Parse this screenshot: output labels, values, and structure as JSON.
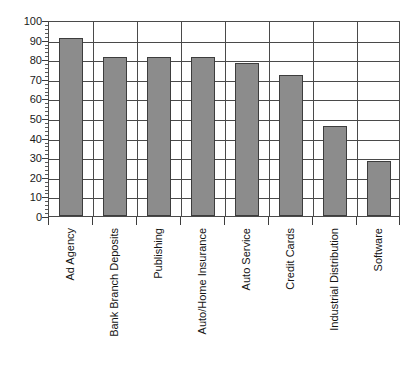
{
  "chart_data": {
    "type": "bar",
    "title": "",
    "subtitle": "",
    "xlabel": "",
    "ylabel": "",
    "ylim": [
      0,
      100
    ],
    "ytick_step": 10,
    "yminor_step": 2,
    "grid": true,
    "legend": false,
    "legend_position": "none",
    "orientation": "vertical",
    "bar_color": "#8c8c8c",
    "bar_edge_color": "#3d3d3d",
    "axis_color": "#4a4a4a",
    "background_color": "#ffffff",
    "categories": [
      "Ad Agency",
      "Bank Branch Deposits",
      "Publishing",
      "Auto/Home Insurance",
      "Auto Service",
      "Credit Cards",
      "Industrial Distribution",
      "Software"
    ],
    "values": [
      91,
      81,
      81,
      81,
      78,
      72,
      46,
      28
    ],
    "ytick_labels": [
      "0",
      "10",
      "20",
      "30",
      "40",
      "50",
      "60",
      "70",
      "80",
      "90",
      "100"
    ],
    "yticks": [
      0,
      10,
      20,
      30,
      40,
      50,
      60,
      70,
      80,
      90,
      100
    ]
  }
}
